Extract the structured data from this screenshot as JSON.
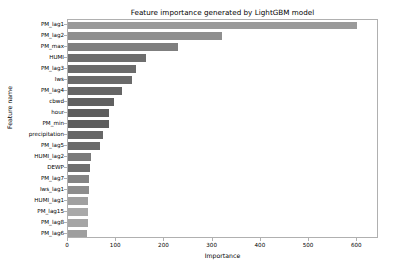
{
  "chart_data": {
    "type": "bar",
    "orientation": "horizontal",
    "title": "Feature importance generated by LightGBM model",
    "xlabel": "Importance",
    "ylabel": "Feature name",
    "xlim": [
      0,
      645
    ],
    "xticks": [
      0,
      100,
      200,
      300,
      400,
      500,
      600
    ],
    "xtick_labels": [
      "0",
      "100",
      "200",
      "300",
      "400",
      "500",
      "600"
    ],
    "grid": false,
    "legend": null,
    "categories": [
      "PM_lag1",
      "PM_lag2",
      "PM_max",
      "HUMI",
      "PM_lag3",
      "Iws",
      "PM_lag4",
      "cbwd",
      "hour",
      "PM_min",
      "precipitation",
      "PM_lag5",
      "HUMI_lag2",
      "DEWP",
      "PM_lag7",
      "Iws_lag1",
      "HUMI_lag1",
      "PM_lag15",
      "PM_lag8",
      "PM_lag6"
    ],
    "values": [
      600,
      320,
      228,
      162,
      140,
      132,
      112,
      95,
      86,
      85,
      72,
      67,
      47,
      46,
      44,
      43,
      42,
      42,
      42,
      40
    ],
    "bar_colors": [
      "#9a9a9a",
      "#8f8f8f",
      "#7f7f7f",
      "#6e6e6e",
      "#6b6b6b",
      "#6a6a6a",
      "#656565",
      "#606060",
      "#5e5e5e",
      "#5e5e5e",
      "#676767",
      "#6b6b6b",
      "#7a7a7a",
      "#6f6f6f",
      "#848484",
      "#8d8d8d",
      "#a0a0a0",
      "#a9a9a9",
      "#a5a5a5",
      "#9e9e9e"
    ]
  }
}
